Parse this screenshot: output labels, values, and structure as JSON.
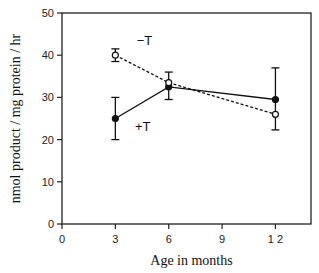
{
  "chart_data": {
    "type": "line",
    "title": "",
    "xlabel": "Age in months",
    "ylabel": "nmol product / mg protein / hr",
    "xlim": [
      0,
      14
    ],
    "ylim": [
      0,
      50
    ],
    "xticks": [
      0,
      3,
      6,
      9,
      12
    ],
    "yticks": [
      0,
      10,
      20,
      30,
      40,
      50
    ],
    "xtick_labels": [
      "0",
      "3",
      "6",
      "9",
      "1 2"
    ],
    "ytick_labels": [
      "0",
      "10",
      "20",
      "30",
      "40",
      "50"
    ],
    "grid": false,
    "legend": "none (inline labels)",
    "series": [
      {
        "name": "+T",
        "label": "+T",
        "marker": "filled-circle",
        "linestyle": "solid",
        "x": [
          3,
          6,
          12
        ],
        "y": [
          25,
          32.5,
          29.5
        ],
        "err_low": [
          20,
          29.5,
          22.3
        ],
        "err_high": [
          30,
          36,
          37
        ]
      },
      {
        "name": "-T",
        "label": "−T",
        "marker": "open-circle",
        "linestyle": "dashed",
        "x": [
          3,
          6,
          12
        ],
        "y": [
          40,
          33.5,
          26
        ],
        "err_low": [
          38.5,
          33.5,
          26
        ],
        "err_high": [
          41.5,
          33.5,
          26
        ]
      }
    ],
    "annotations": [
      {
        "text": "−T",
        "x": 4.2,
        "y": 42.5
      },
      {
        "text": "+T",
        "x": 4.1,
        "y": 22
      }
    ]
  }
}
